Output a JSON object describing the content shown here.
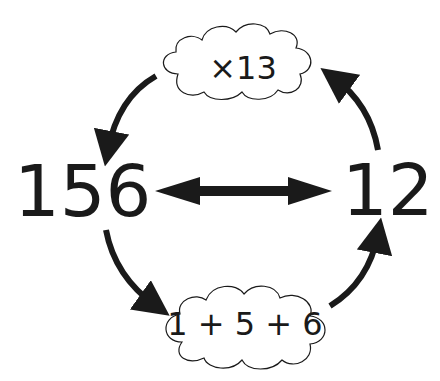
{
  "diagram": {
    "left_number": "156",
    "right_number": "12",
    "top_cloud": {
      "label": "×13"
    },
    "bottom_cloud": {
      "label": "1 + 5 + 6"
    },
    "colors": {
      "ink": "#1a1a1a",
      "background": "#ffffff"
    }
  }
}
